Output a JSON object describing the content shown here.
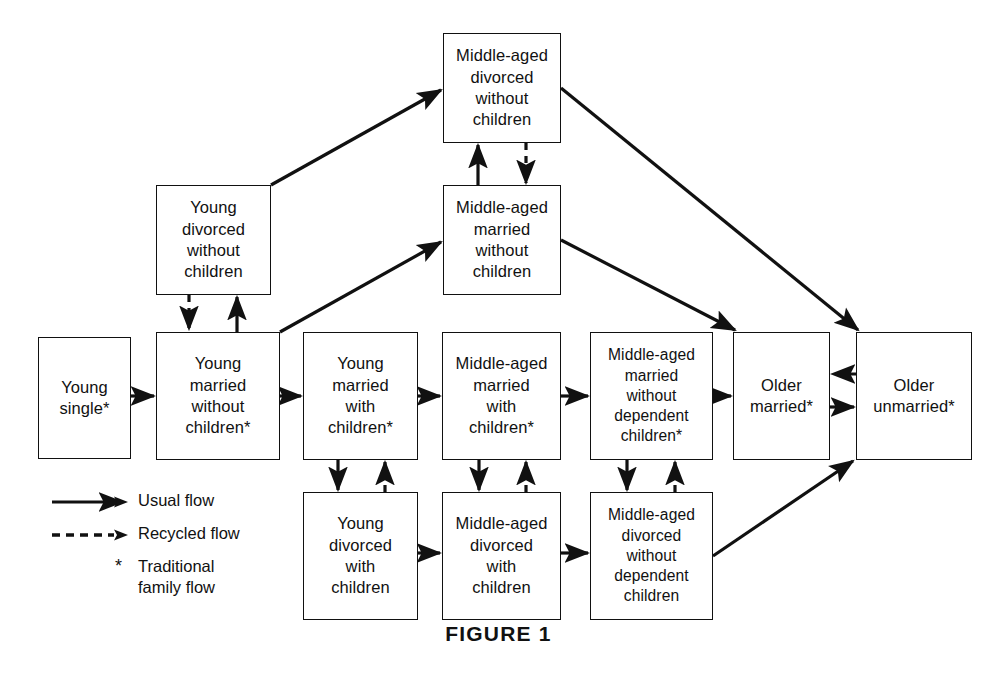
{
  "figure": {
    "caption": "FIGURE 1"
  },
  "colors": {
    "stroke": "#111111",
    "background": "#ffffff",
    "text": "#111111"
  },
  "nodes": [
    {
      "id": "young-single",
      "label": "Young\nsingle*",
      "x": 38,
      "y": 337,
      "w": 93,
      "h": 122
    },
    {
      "id": "young-married-without-children",
      "label": "Young\nmarried\nwithout\nchildren*",
      "x": 156,
      "y": 332,
      "w": 124,
      "h": 128
    },
    {
      "id": "young-married-with-children",
      "label": "Young\nmarried\nwith\nchildren*",
      "x": 303,
      "y": 332,
      "w": 115,
      "h": 128
    },
    {
      "id": "middle-aged-married-with-children",
      "label": "Middle-aged\nmarried\nwith\nchildren*",
      "x": 442,
      "y": 332,
      "w": 119,
      "h": 128
    },
    {
      "id": "middle-aged-married-without-dependent-children",
      "label": "Middle-aged\nmarried\nwithout\ndependent\nchildren*",
      "x": 590,
      "y": 332,
      "w": 123,
      "h": 128
    },
    {
      "id": "older-married",
      "label": "Older\nmarried*",
      "x": 733,
      "y": 332,
      "w": 97,
      "h": 128
    },
    {
      "id": "older-unmarried",
      "label": "Older\nunmarried*",
      "x": 856,
      "y": 332,
      "w": 116,
      "h": 128
    },
    {
      "id": "young-divorced-without-children",
      "label": "Young\ndivorced\nwithout\nchildren",
      "x": 156,
      "y": 185,
      "w": 115,
      "h": 110
    },
    {
      "id": "middle-aged-married-without-children",
      "label": "Middle-aged\nmarried\nwithout\nchildren",
      "x": 443,
      "y": 185,
      "w": 118,
      "h": 110
    },
    {
      "id": "middle-aged-divorced-without-children",
      "label": "Middle-aged\ndivorced\nwithout\nchildren",
      "x": 443,
      "y": 33,
      "w": 118,
      "h": 110
    },
    {
      "id": "young-divorced-with-children",
      "label": "Young\ndivorced\nwith\nchildren",
      "x": 303,
      "y": 492,
      "w": 115,
      "h": 128
    },
    {
      "id": "middle-aged-divorced-with-children",
      "label": "Middle-aged\ndivorced\nwith\nchildren",
      "x": 442,
      "y": 492,
      "w": 119,
      "h": 128
    },
    {
      "id": "middle-aged-divorced-without-dependent-children",
      "label": "Middle-aged\ndivorced\nwithout\ndependent\nchildren",
      "x": 590,
      "y": 492,
      "w": 123,
      "h": 128
    }
  ],
  "edges": [
    {
      "id": "young-single-to-young-married-without-children",
      "type": "usual",
      "from": "young-single",
      "to": "young-married-without-children"
    },
    {
      "id": "young-married-without-to-young-married-with",
      "type": "usual",
      "from": "young-married-without-children",
      "to": "young-married-with-children"
    },
    {
      "id": "young-married-with-to-middle-aged-married-with",
      "type": "usual",
      "from": "young-married-with-children",
      "to": "middle-aged-married-with-children"
    },
    {
      "id": "middle-aged-married-with-to-without-dependent",
      "type": "usual",
      "from": "middle-aged-married-with-children",
      "to": "middle-aged-married-without-dependent-children"
    },
    {
      "id": "middle-aged-married-without-dependent-to-older-married",
      "type": "usual",
      "from": "middle-aged-married-without-dependent-children",
      "to": "older-married"
    },
    {
      "id": "older-married-to-older-unmarried",
      "type": "usual",
      "from": "older-married",
      "to": "older-unmarried"
    },
    {
      "id": "older-unmarried-to-older-married",
      "type": "recycled",
      "from": "older-unmarried",
      "to": "older-married"
    },
    {
      "id": "young-married-without-to-young-divorced-without",
      "type": "recycled",
      "from": "young-married-without-children",
      "to": "young-divorced-without-children"
    },
    {
      "id": "young-divorced-without-to-young-married-without",
      "type": "usual",
      "from": "young-divorced-without-children",
      "to": "young-married-without-children"
    },
    {
      "id": "young-divorced-without-to-middle-aged-divorced-without",
      "type": "usual",
      "from": "young-divorced-without-children",
      "to": "middle-aged-divorced-without-children"
    },
    {
      "id": "young-married-without-to-middle-aged-married-without",
      "type": "usual",
      "from": "young-married-without-children",
      "to": "middle-aged-married-without-children"
    },
    {
      "id": "middle-aged-married-without-to-divorced-without",
      "type": "usual",
      "from": "middle-aged-married-without-children",
      "to": "middle-aged-divorced-without-children"
    },
    {
      "id": "middle-aged-divorced-without-to-married-without",
      "type": "recycled",
      "from": "middle-aged-divorced-without-children",
      "to": "middle-aged-married-without-children"
    },
    {
      "id": "middle-aged-divorced-without-children-to-older-unmarried",
      "type": "usual",
      "from": "middle-aged-divorced-without-children",
      "to": "older-unmarried"
    },
    {
      "id": "middle-aged-married-without-children-to-older-married",
      "type": "usual",
      "from": "middle-aged-married-without-children",
      "to": "older-married"
    },
    {
      "id": "young-married-with-to-young-divorced-with",
      "type": "usual",
      "from": "young-married-with-children",
      "to": "young-divorced-with-children"
    },
    {
      "id": "young-divorced-with-to-young-married-with",
      "type": "recycled",
      "from": "young-divorced-with-children",
      "to": "young-married-with-children"
    },
    {
      "id": "middle-aged-married-with-to-divorced-with",
      "type": "usual",
      "from": "middle-aged-married-with-children",
      "to": "middle-aged-divorced-with-children"
    },
    {
      "id": "middle-aged-divorced-with-to-married-with",
      "type": "recycled",
      "from": "middle-aged-divorced-with-children",
      "to": "middle-aged-married-with-children"
    },
    {
      "id": "middle-aged-married-without-dependent-to-divorced-without-dependent",
      "type": "usual",
      "from": "middle-aged-married-without-dependent-children",
      "to": "middle-aged-divorced-without-dependent-children"
    },
    {
      "id": "middle-aged-divorced-without-dependent-to-married-without-dependent",
      "type": "recycled",
      "from": "middle-aged-divorced-without-dependent-children",
      "to": "middle-aged-married-without-dependent-children"
    },
    {
      "id": "young-divorced-with-to-middle-aged-divorced-with",
      "type": "usual",
      "from": "young-divorced-with-children",
      "to": "middle-aged-divorced-with-children"
    },
    {
      "id": "middle-aged-divorced-with-to-without-dependent",
      "type": "usual",
      "from": "middle-aged-divorced-with-children",
      "to": "middle-aged-divorced-without-dependent-children"
    },
    {
      "id": "middle-aged-divorced-without-dependent-to-older-unmarried",
      "type": "usual",
      "from": "middle-aged-divorced-without-dependent-children",
      "to": "older-unmarried"
    }
  ],
  "legend": {
    "items": [
      {
        "id": "usual-flow",
        "symbol": "solid-arrow",
        "label": "Usual flow"
      },
      {
        "id": "recycled-flow",
        "symbol": "dashed-arrow",
        "label": "Recycled flow"
      },
      {
        "id": "traditional-family-flow",
        "symbol": "asterisk",
        "marker": "*",
        "label": "Traditional\nfamily flow"
      }
    ]
  }
}
